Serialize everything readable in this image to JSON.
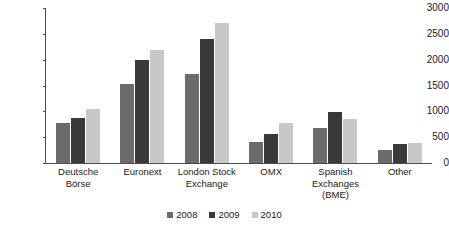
{
  "chart_data": {
    "type": "bar",
    "title": "",
    "subtitle": "",
    "xlabel": "",
    "ylabel": "",
    "ylim": [
      0,
      3000
    ],
    "ytick_labels": [
      "3000",
      "2500",
      "2000",
      "1500",
      "1000",
      "500",
      "0"
    ],
    "ytick_values": [
      3000,
      2500,
      2000,
      1500,
      1000,
      500,
      0
    ],
    "grid": false,
    "legend_position": "bottom",
    "categories": [
      "Deutsche\nBörse",
      "Euronext",
      "London Stock\nExchange",
      "OMX",
      "Spanish\nExchanges\n(BME)",
      "Other"
    ],
    "series": [
      {
        "name": "2008",
        "color": "#6b6b6b",
        "values": [
          780,
          1520,
          1730,
          400,
          670,
          260
        ]
      },
      {
        "name": "2009",
        "color": "#3a3a3a",
        "values": [
          870,
          2000,
          2400,
          560,
          990,
          370
        ]
      },
      {
        "name": "2010",
        "color": "#c8c8c8",
        "values": [
          1050,
          2190,
          2710,
          770,
          860,
          390
        ]
      }
    ]
  },
  "axis": {
    "line_color": "#4d4d4d"
  }
}
